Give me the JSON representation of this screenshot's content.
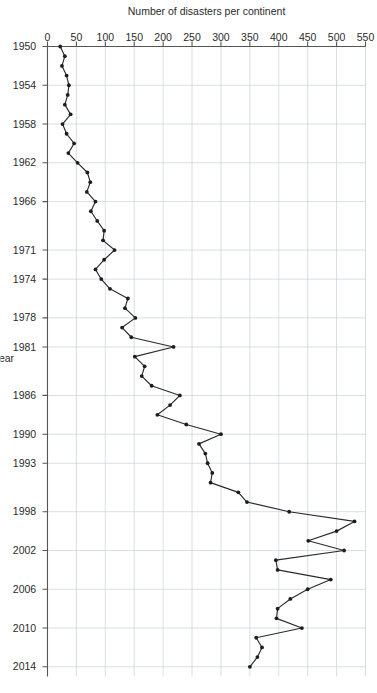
{
  "figure": {
    "background_color": "#ffffff",
    "rotation_degrees": 90,
    "width": 377,
    "height": 693
  },
  "style": {
    "line_color": "#2b2b2b",
    "marker_color": "#1d1d1d",
    "grid_color": "#c8d0dc",
    "axis_color": "#555555",
    "text_color": "#2b2b2b"
  },
  "chart_data": {
    "type": "line",
    "title": "",
    "xlabel": "Year",
    "ylabel": "Number of disasters per continent",
    "xlim": [
      1950,
      2015
    ],
    "ylim": [
      0,
      550
    ],
    "grid": true,
    "legend": false,
    "legend_position": "none",
    "marker": "filled-circle",
    "xtick_labels": [
      "1950",
      "1954",
      "1958",
      "1962",
      "1966",
      "1971",
      "1974",
      "1978",
      "1981",
      "1986",
      "1990",
      "1993",
      "1998",
      "2002",
      "2006",
      "2010",
      "2014"
    ],
    "xtick_values": [
      1950,
      1954,
      1958,
      1962,
      1966,
      1971,
      1974,
      1978,
      1981,
      1986,
      1990,
      1993,
      1998,
      2002,
      2006,
      2010,
      2014
    ],
    "ytick_labels": [
      "0",
      "50",
      "100",
      "150",
      "200",
      "250",
      "300",
      "350",
      "400",
      "450",
      "500",
      "550"
    ],
    "ytick_values": [
      0,
      50,
      100,
      150,
      200,
      250,
      300,
      350,
      400,
      450,
      500,
      550
    ],
    "x": [
      1950,
      1951,
      1952,
      1953,
      1954,
      1955,
      1956,
      1957,
      1958,
      1959,
      1960,
      1961,
      1962,
      1963,
      1964,
      1965,
      1966,
      1967,
      1968,
      1969,
      1970,
      1971,
      1972,
      1973,
      1974,
      1975,
      1976,
      1977,
      1978,
      1979,
      1980,
      1981,
      1982,
      1983,
      1984,
      1985,
      1986,
      1987,
      1988,
      1989,
      1990,
      1991,
      1992,
      1993,
      1994,
      1995,
      1996,
      1997,
      1998,
      1999,
      2000,
      2001,
      2002,
      2003,
      2004,
      2005,
      2006,
      2007,
      2008,
      2009,
      2010,
      2011,
      2012,
      2013,
      2014
    ],
    "series": [
      {
        "name": "Number of disasters per continent",
        "values": [
          22,
          30,
          25,
          33,
          37,
          35,
          30,
          40,
          26,
          33,
          46,
          36,
          52,
          69,
          74,
          68,
          83,
          75,
          86,
          98,
          96,
          116,
          98,
          83,
          93,
          108,
          139,
          134,
          152,
          129,
          145,
          218,
          151,
          168,
          163,
          180,
          229,
          212,
          190,
          240,
          300,
          262,
          273,
          277,
          285,
          282,
          330,
          345,
          418,
          531,
          500,
          451,
          513,
          395,
          398,
          490,
          450,
          420,
          398,
          396,
          440,
          361,
          371,
          363,
          350
        ]
      }
    ]
  }
}
